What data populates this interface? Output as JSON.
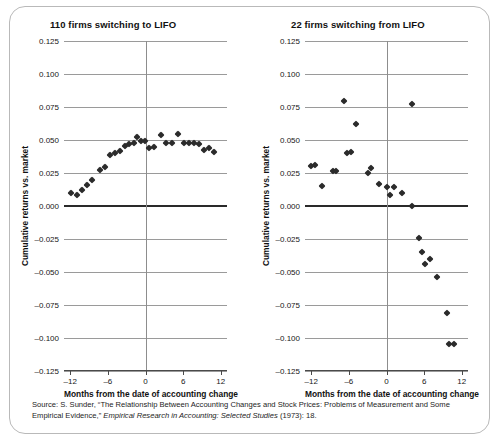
{
  "figure": {
    "source_prefix": "Source: S. Sunder, “The Relationship Between Accounting Changes and Stock Prices: Problems of Measurement and Some Empirical Evidence,” ",
    "source_italic": "Empirical Research in Accounting: Selected Studies",
    "source_suffix": " (1973): 18."
  },
  "chart_data": [
    {
      "type": "scatter",
      "panel": "left",
      "title": "110 firms switching to LIFO",
      "xlabel": "Months from the date of accounting change",
      "ylabel": "Cumulative returns vs. market",
      "xlim": [
        -13,
        13
      ],
      "ylim": [
        -0.125,
        0.125
      ],
      "xticks": [
        -12,
        -6,
        0,
        6,
        12
      ],
      "xtick_labels": [
        "–12",
        "–6",
        "0",
        "6",
        "12"
      ],
      "yticks": [
        0.125,
        0.1,
        0.075,
        0.05,
        0.025,
        0.0,
        -0.025,
        -0.05,
        -0.075,
        -0.1,
        -0.125
      ],
      "ytick_labels": [
        "0.125",
        "0.100",
        "0.075",
        "0.050",
        "0.025",
        "0.000",
        "–0.025",
        "–0.050",
        "–0.075",
        "–0.100",
        "–0.125"
      ],
      "grid": true,
      "zero_line_y": 0.0,
      "zero_line_x": 0,
      "points": [
        {
          "x": -11.9,
          "y": 0.0095
        },
        {
          "x": -11.0,
          "y": 0.008
        },
        {
          "x": -10.2,
          "y": 0.012
        },
        {
          "x": -9.4,
          "y": 0.0158
        },
        {
          "x": -8.6,
          "y": 0.0197
        },
        {
          "x": -7.2,
          "y": 0.027
        },
        {
          "x": -6.4,
          "y": 0.0293
        },
        {
          "x": -5.6,
          "y": 0.0388
        },
        {
          "x": -4.8,
          "y": 0.04
        },
        {
          "x": -4.0,
          "y": 0.0415
        },
        {
          "x": -3.3,
          "y": 0.0452
        },
        {
          "x": -2.6,
          "y": 0.047
        },
        {
          "x": -1.9,
          "y": 0.0478
        },
        {
          "x": -1.3,
          "y": 0.0524
        },
        {
          "x": -0.7,
          "y": 0.0492
        },
        {
          "x": -0.1,
          "y": 0.0489
        },
        {
          "x": 0.5,
          "y": 0.0442
        },
        {
          "x": 1.3,
          "y": 0.0446
        },
        {
          "x": 2.4,
          "y": 0.0536
        },
        {
          "x": 3.3,
          "y": 0.0478
        },
        {
          "x": 4.3,
          "y": 0.0478
        },
        {
          "x": 5.2,
          "y": 0.0545
        },
        {
          "x": 6.1,
          "y": 0.048
        },
        {
          "x": 6.9,
          "y": 0.0478
        },
        {
          "x": 7.7,
          "y": 0.0478
        },
        {
          "x": 8.6,
          "y": 0.047
        },
        {
          "x": 9.4,
          "y": 0.0424
        },
        {
          "x": 10.1,
          "y": 0.0443
        },
        {
          "x": 11.0,
          "y": 0.041
        }
      ]
    },
    {
      "type": "scatter",
      "panel": "right",
      "title": "22 firms switching from LIFO",
      "xlabel": "Months from the date of accounting change",
      "ylabel": "Cumulative returns vs. market",
      "xlim": [
        -13,
        13
      ],
      "ylim": [
        -0.125,
        0.125
      ],
      "xticks": [
        -12,
        -6,
        0,
        6,
        12
      ],
      "xtick_labels": [
        "–12",
        "–6",
        "0",
        "6",
        "12"
      ],
      "yticks": [
        0.125,
        0.1,
        0.075,
        0.05,
        0.025,
        0.0,
        -0.025,
        -0.05,
        -0.075,
        -0.1,
        -0.125
      ],
      "ytick_labels": [
        "0.125",
        "0.100",
        "0.075",
        "0.050",
        "0.025",
        "0.000",
        "–0.025",
        "–0.050",
        "–0.075",
        "–0.100",
        "–0.125"
      ],
      "grid": true,
      "zero_line_y": 0.0,
      "zero_line_x": 0,
      "points": [
        {
          "x": -12.0,
          "y": 0.0302
        },
        {
          "x": -11.4,
          "y": 0.031
        },
        {
          "x": -10.3,
          "y": 0.0148
        },
        {
          "x": -8.6,
          "y": 0.0264
        },
        {
          "x": -8.0,
          "y": 0.0266
        },
        {
          "x": -6.8,
          "y": 0.0795
        },
        {
          "x": -6.3,
          "y": 0.0405
        },
        {
          "x": -5.7,
          "y": 0.041
        },
        {
          "x": -4.8,
          "y": 0.0625
        },
        {
          "x": -2.9,
          "y": 0.0253
        },
        {
          "x": -2.4,
          "y": 0.0288
        },
        {
          "x": -1.2,
          "y": 0.0164
        },
        {
          "x": 0.0,
          "y": 0.0142
        },
        {
          "x": 0.5,
          "y": 0.0082
        },
        {
          "x": 1.2,
          "y": 0.0143
        },
        {
          "x": 2.4,
          "y": 0.01
        },
        {
          "x": 4.0,
          "y": 0.0
        },
        {
          "x": 4.1,
          "y": 0.077
        },
        {
          "x": 5.2,
          "y": -0.0243
        },
        {
          "x": 5.6,
          "y": -0.0352
        },
        {
          "x": 6.1,
          "y": -0.0437
        },
        {
          "x": 6.9,
          "y": -0.0405
        },
        {
          "x": 8.0,
          "y": -0.0535
        },
        {
          "x": 9.6,
          "y": -0.0813
        },
        {
          "x": 9.9,
          "y": -0.1045
        },
        {
          "x": 10.8,
          "y": -0.1045
        }
      ]
    }
  ]
}
